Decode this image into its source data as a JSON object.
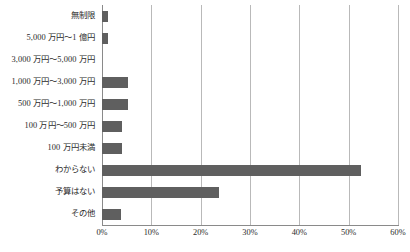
{
  "chart_data": {
    "type": "bar",
    "orientation": "horizontal",
    "title": "",
    "subtitle": "",
    "xlabel": "",
    "ylabel": "",
    "xlim": [
      0,
      60
    ],
    "xtick_step": 10,
    "xtick_labels": [
      "0%",
      "10%",
      "20%",
      "30%",
      "40%",
      "50%",
      "60%"
    ],
    "xtick_values": [
      0,
      10,
      20,
      30,
      40,
      50,
      60
    ],
    "grid": "vertical",
    "legend": "none",
    "value_unit": "%",
    "bar_color": "#5f5f5f",
    "gridline_color": "#b9b9b9",
    "axis_color": "#8a8a8a",
    "categories": [
      "無制限",
      "5,000 万円～1 億円",
      "3,000 万円～5,000 万円",
      "1,000 万円～3,000 万円",
      "500 万円～1,000 万円",
      "100 万円～500 万円",
      "100 万円未満",
      "わからない",
      "予算はない",
      "その他"
    ],
    "values": [
      1.3,
      1.3,
      0.0,
      5.3,
      5.3,
      4.1,
      4.0,
      52.6,
      23.7,
      3.9
    ]
  }
}
